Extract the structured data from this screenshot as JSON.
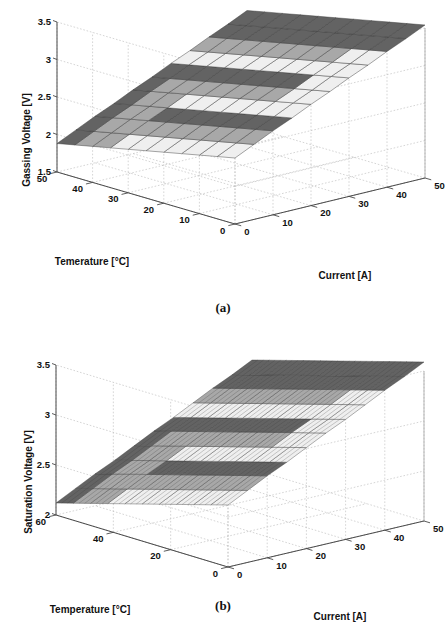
{
  "figure": {
    "panels": [
      {
        "id": "a",
        "caption": "(a)",
        "zlabel": "Gassing Voltage [V]",
        "xlabel": "Temerature [°C]",
        "ylabel": "Current [A]",
        "zticks": [
          "3.5",
          "3",
          "2.5",
          "2",
          "1.5"
        ],
        "xticks": [
          "50",
          "40",
          "30",
          "20",
          "10",
          "0"
        ],
        "yticks": [
          "0",
          "10",
          "20",
          "30",
          "40",
          "50"
        ]
      },
      {
        "id": "b",
        "caption": "(b)",
        "zlabel": "Saturation Voltage [V]",
        "xlabel": "Temperature [°C]",
        "ylabel": "Current [A]",
        "zticks": [
          "3.5",
          "3",
          "2.5",
          "2"
        ],
        "xticks": [
          "60",
          "40",
          "20",
          "0"
        ],
        "yticks": [
          "0",
          "10",
          "20",
          "30",
          "40",
          "50"
        ]
      }
    ]
  },
  "chart_data": [
    {
      "type": "surface",
      "panel": "a",
      "title": "",
      "xlabel": "Temerature [°C]",
      "ylabel": "Current [A]",
      "zlabel": "Gassing Voltage [V]",
      "xlim": [
        0,
        50
      ],
      "ylim": [
        0,
        50
      ],
      "zlim": [
        1.5,
        3.5
      ],
      "xticks": [
        0,
        10,
        20,
        30,
        40,
        50
      ],
      "yticks": [
        0,
        10,
        20,
        30,
        40,
        50
      ],
      "zticks": [
        1.5,
        2,
        2.5,
        3,
        3.5
      ],
      "grid": true,
      "legend": null,
      "x": [
        0,
        5,
        10,
        15,
        20,
        25,
        30,
        35,
        40,
        45,
        50
      ],
      "y": [
        0,
        5,
        10,
        15,
        20,
        25,
        30,
        35,
        40,
        45,
        50
      ],
      "z_description": "Planar surface rising with current, falling with temperature",
      "z": [
        [
          2.38,
          2.5,
          2.62,
          2.73,
          2.85,
          2.96,
          3.08,
          3.19,
          3.31,
          3.42,
          3.54
        ],
        [
          2.33,
          2.45,
          2.57,
          2.68,
          2.8,
          2.91,
          3.03,
          3.14,
          3.26,
          3.37,
          3.49
        ],
        [
          2.28,
          2.4,
          2.52,
          2.63,
          2.75,
          2.86,
          2.98,
          3.09,
          3.21,
          3.32,
          3.44
        ],
        [
          2.23,
          2.35,
          2.47,
          2.58,
          2.7,
          2.81,
          2.93,
          3.04,
          3.16,
          3.27,
          3.39
        ],
        [
          2.18,
          2.3,
          2.42,
          2.53,
          2.65,
          2.76,
          2.88,
          2.99,
          3.11,
          3.22,
          3.34
        ],
        [
          2.13,
          2.25,
          2.37,
          2.48,
          2.6,
          2.71,
          2.83,
          2.94,
          3.06,
          3.17,
          3.29
        ],
        [
          2.08,
          2.2,
          2.32,
          2.43,
          2.55,
          2.66,
          2.78,
          2.89,
          3.01,
          3.12,
          3.24
        ],
        [
          2.03,
          2.15,
          2.27,
          2.38,
          2.5,
          2.61,
          2.73,
          2.84,
          2.96,
          3.07,
          3.19
        ],
        [
          1.98,
          2.1,
          2.22,
          2.33,
          2.45,
          2.56,
          2.68,
          2.79,
          2.91,
          3.02,
          3.14
        ],
        [
          1.93,
          2.05,
          2.17,
          2.28,
          2.4,
          2.51,
          2.63,
          2.74,
          2.86,
          2.97,
          3.09
        ],
        [
          1.88,
          2.0,
          2.12,
          2.23,
          2.35,
          2.46,
          2.58,
          2.69,
          2.81,
          2.92,
          3.04
        ]
      ]
    },
    {
      "type": "surface",
      "panel": "b",
      "title": "",
      "xlabel": "Temperature [°C]",
      "ylabel": "Current [A]",
      "zlabel": "Saturation Voltage [V]",
      "xlim": [
        0,
        60
      ],
      "ylim": [
        0,
        50
      ],
      "zlim": [
        2,
        3.5
      ],
      "xticks": [
        0,
        20,
        40,
        60
      ],
      "yticks": [
        0,
        10,
        20,
        30,
        40,
        50
      ],
      "zticks": [
        2,
        2.5,
        3,
        3.5
      ],
      "grid": true,
      "legend": null,
      "x": [
        0,
        6,
        12,
        18,
        24,
        30,
        36,
        42,
        48,
        54,
        60
      ],
      "y": [
        0,
        5,
        10,
        15,
        20,
        25,
        30,
        35,
        40,
        45,
        50
      ],
      "z_description": "Planar surface rising with current, falling with temperature",
      "z": [
        [
          2.62,
          2.72,
          2.82,
          2.91,
          3.01,
          3.11,
          3.2,
          3.3,
          3.4,
          3.49,
          3.59
        ],
        [
          2.57,
          2.67,
          2.77,
          2.86,
          2.96,
          3.06,
          3.15,
          3.25,
          3.35,
          3.44,
          3.54
        ],
        [
          2.52,
          2.62,
          2.72,
          2.81,
          2.91,
          3.01,
          3.1,
          3.2,
          3.3,
          3.39,
          3.49
        ],
        [
          2.47,
          2.57,
          2.67,
          2.76,
          2.86,
          2.96,
          3.05,
          3.15,
          3.25,
          3.34,
          3.44
        ],
        [
          2.42,
          2.52,
          2.62,
          2.71,
          2.81,
          2.91,
          3.0,
          3.1,
          3.2,
          3.29,
          3.39
        ],
        [
          2.37,
          2.47,
          2.57,
          2.66,
          2.76,
          2.86,
          2.95,
          3.05,
          3.15,
          3.24,
          3.34
        ],
        [
          2.32,
          2.42,
          2.52,
          2.61,
          2.71,
          2.81,
          2.9,
          3.0,
          3.1,
          3.19,
          3.29
        ],
        [
          2.27,
          2.37,
          2.47,
          2.56,
          2.66,
          2.76,
          2.85,
          2.95,
          3.05,
          3.14,
          3.24
        ],
        [
          2.22,
          2.32,
          2.42,
          2.51,
          2.61,
          2.71,
          2.8,
          2.9,
          3.0,
          3.09,
          3.19
        ],
        [
          2.17,
          2.27,
          2.37,
          2.46,
          2.56,
          2.66,
          2.75,
          2.85,
          2.95,
          3.04,
          3.14
        ],
        [
          2.12,
          2.22,
          2.32,
          2.41,
          2.51,
          2.61,
          2.7,
          2.8,
          2.9,
          2.99,
          3.09
        ]
      ]
    }
  ],
  "style": {
    "surface_dark": "#636363",
    "surface_mid": "#a8a8a8",
    "surface_light": "#efefef",
    "mesh_stroke": "#3a3a3a",
    "grid_color": "#b9b9b9",
    "axis_color": "#4a4a4a",
    "background": "#ffffff"
  }
}
